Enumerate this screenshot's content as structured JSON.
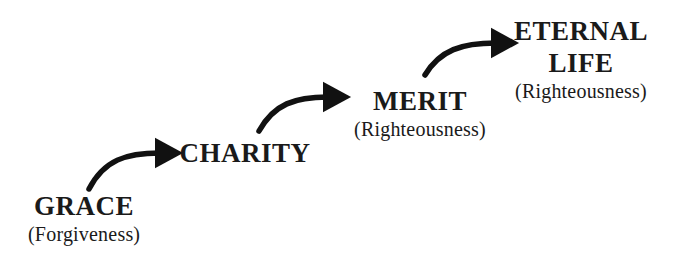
{
  "diagram": {
    "type": "staircase-flow",
    "colors": {
      "background": "#ffffff",
      "text": "#1a1a1a",
      "arrow": "#111111"
    },
    "stages": [
      {
        "title": "GRACE",
        "subtitle": "(Forgiveness)"
      },
      {
        "title": "CHARITY",
        "subtitle": ""
      },
      {
        "title": "MERIT",
        "subtitle": "(Righteousness)"
      },
      {
        "title_line1": "ETERNAL",
        "title_line2": "LIFE",
        "subtitle": "(Righteousness)"
      }
    ],
    "arrows": [
      {
        "from": "GRACE",
        "to": "CHARITY",
        "icon": "curved-arrow-right"
      },
      {
        "from": "CHARITY",
        "to": "MERIT",
        "icon": "curved-arrow-right"
      },
      {
        "from": "MERIT",
        "to": "ETERNAL LIFE",
        "icon": "curved-arrow-right"
      }
    ]
  }
}
